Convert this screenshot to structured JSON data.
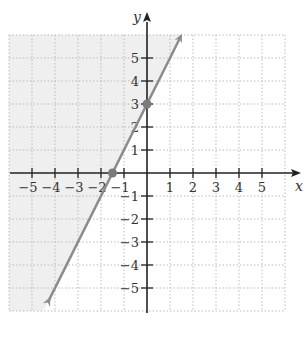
{
  "chart_data": {
    "type": "line",
    "title": "",
    "xlabel": "x",
    "ylabel": "y",
    "xlim": [
      -6,
      6
    ],
    "ylim": [
      -6,
      6
    ],
    "grid": true,
    "x_ticks": [
      -5,
      -4,
      -3,
      -2,
      -1,
      1,
      2,
      3,
      4,
      5
    ],
    "y_ticks": [
      -5,
      -4,
      -3,
      -2,
      -1,
      1,
      2,
      3,
      4,
      5
    ],
    "x_tick_labels": [
      "−5",
      "−4",
      "−3",
      "−2",
      "−1",
      "1",
      "2",
      "3",
      "4",
      "5"
    ],
    "y_tick_labels": [
      "−5",
      "−4",
      "−3",
      "−2",
      "−1",
      "1",
      "2",
      "3",
      "4",
      "5"
    ],
    "series": [
      {
        "name": "boundary line y = 2x + 3",
        "style": "solid",
        "slope": 2,
        "intercept": 3,
        "x": [
          -5.3,
          1.4
        ],
        "y": [
          -7.6,
          5.8
        ],
        "color": "#8c8c8c"
      }
    ],
    "points": [
      {
        "x": 0,
        "y": 3,
        "label": "y-intercept"
      },
      {
        "x": -1.5,
        "y": 0,
        "label": "x-intercept"
      }
    ],
    "shaded_region": {
      "inequality": "y >= 2x + 3",
      "side": "left/above line",
      "color": "#efefef"
    }
  },
  "colors": {
    "axis": "#222222",
    "grid": "#bbbbbb",
    "line": "#8c8c8c",
    "shade": "#efefef",
    "point": "#7a7a7a"
  }
}
